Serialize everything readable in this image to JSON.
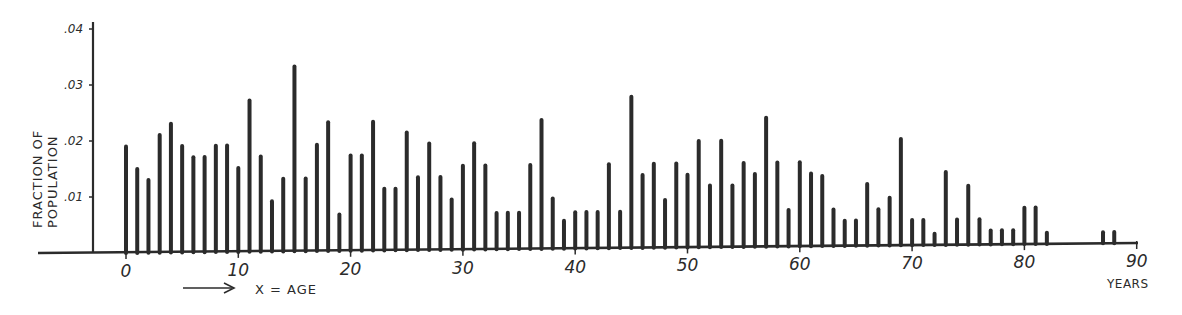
{
  "chart_data": {
    "type": "bar",
    "style": "hand-drawn line (spike) plot",
    "title": "",
    "ylabel": "FRACTION OF POPULATION",
    "ylabel_lines": [
      "FRACTION OF",
      "POPULATION"
    ],
    "xlabel": "X = AGE",
    "xlabel_arrow": "⟶",
    "x_unit_label": "YEARS",
    "ylim": [
      0,
      0.04
    ],
    "xlim": [
      0,
      90
    ],
    "yticks": [
      0.01,
      0.02,
      0.03,
      0.04
    ],
    "ytick_labels": [
      ".01",
      ".02",
      ".03",
      ".04"
    ],
    "xticks": [
      0,
      10,
      20,
      30,
      40,
      50,
      60,
      70,
      80,
      90
    ],
    "xtick_labels": [
      "0",
      "10",
      "20",
      "30",
      "40",
      "50",
      "60",
      "70",
      "80",
      "90"
    ],
    "grid": false,
    "legend": null,
    "ink_color": "#2b2b2b",
    "x": [
      0,
      1,
      2,
      3,
      4,
      5,
      6,
      7,
      8,
      9,
      10,
      11,
      12,
      13,
      14,
      15,
      16,
      17,
      18,
      19,
      20,
      21,
      22,
      23,
      24,
      25,
      26,
      27,
      28,
      29,
      30,
      31,
      32,
      33,
      34,
      35,
      36,
      37,
      38,
      39,
      40,
      41,
      42,
      43,
      44,
      45,
      46,
      47,
      48,
      49,
      50,
      51,
      52,
      53,
      54,
      55,
      56,
      57,
      58,
      59,
      60,
      61,
      62,
      63,
      64,
      65,
      66,
      67,
      68,
      69,
      70,
      71,
      72,
      73,
      74,
      75,
      76,
      77,
      78,
      79,
      80,
      81,
      82,
      87,
      88
    ],
    "values": [
      0.019,
      0.015,
      0.013,
      0.021,
      0.023,
      0.019,
      0.017,
      0.017,
      0.019,
      0.019,
      0.015,
      0.027,
      0.017,
      0.009,
      0.013,
      0.033,
      0.013,
      0.019,
      0.023,
      0.0065,
      0.017,
      0.017,
      0.023,
      0.011,
      0.011,
      0.021,
      0.013,
      0.019,
      0.013,
      0.009,
      0.015,
      0.019,
      0.015,
      0.0065,
      0.0065,
      0.0065,
      0.015,
      0.023,
      0.009,
      0.005,
      0.0065,
      0.0065,
      0.0065,
      0.015,
      0.0065,
      0.027,
      0.013,
      0.015,
      0.0085,
      0.015,
      0.013,
      0.019,
      0.011,
      0.019,
      0.011,
      0.015,
      0.013,
      0.023,
      0.015,
      0.0065,
      0.015,
      0.013,
      0.0125,
      0.0065,
      0.0045,
      0.0045,
      0.011,
      0.0065,
      0.0085,
      0.019,
      0.0045,
      0.0045,
      0.002,
      0.013,
      0.0045,
      0.0105,
      0.0045,
      0.0025,
      0.0025,
      0.0025,
      0.0065,
      0.0065,
      0.002,
      0.002,
      0.002
    ]
  }
}
